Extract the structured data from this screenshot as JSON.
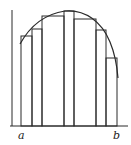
{
  "diagram": {
    "labels": {
      "a": "a",
      "b": "b"
    },
    "colors": {
      "stroke": "#2a2a2a",
      "background": "#ffffff"
    },
    "partition_x": [
      21,
      32,
      42,
      64,
      74,
      96,
      106,
      117
    ],
    "rect_tops": [
      36,
      29,
      16,
      11,
      19,
      30,
      58
    ],
    "axis": {
      "origin_x": 12,
      "origin_y": 126,
      "x_end": 128,
      "y_top": 10
    }
  }
}
